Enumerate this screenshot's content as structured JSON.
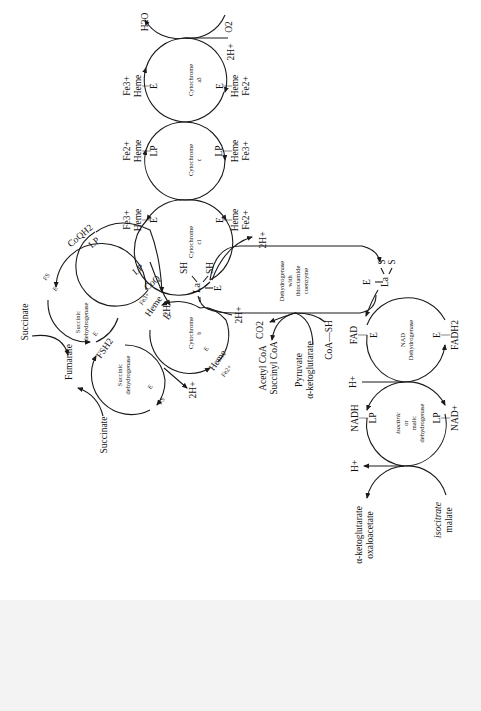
{
  "diagram": {
    "orientation": "rotated 90 degrees counter-clockwise (text reads bottom-to-top)",
    "enzymes": {
      "cyt_a3": {
        "line1": "Cytochrome",
        "line2": "a3"
      },
      "cyt_c": {
        "line1": "Cytochrome",
        "line2": "c"
      },
      "cyt_c1": {
        "line1": "Cytochrome",
        "line2": "c1"
      },
      "cyt_b": {
        "line1": "Cytochrome",
        "line2": "b"
      },
      "sdh_upper": {
        "line1": "Succinic",
        "line2": "dehydrogenase"
      },
      "sdh_lower": {
        "line1": "Succinic",
        "line2": "dehydrogenase"
      },
      "lipoamide": {
        "line1": "Dehydrogenase",
        "line2": "with",
        "line3": "thioctamide",
        "line4": "coenzyme"
      },
      "nad_dh": {
        "line1": "NAD",
        "line2": "Dehydrogenase"
      },
      "iso_malic": {
        "line1": "isocitric",
        "line2": "or",
        "line3": "malic",
        "line4": "dehydrogenase"
      }
    },
    "labels": {
      "h2o": "H2O",
      "o2": "O2",
      "two_h_plus": "2H+",
      "h_plus": "H+",
      "fe3": "Fe3+",
      "fe2": "Fe2+",
      "heme": "Heme",
      "e": "E",
      "lp": "LP",
      "bar": "|",
      "coqh2": "CoQH2",
      "coq": "CoQ",
      "fs": "FS",
      "fsh2": "FSH2",
      "succinate": "Succinate",
      "fumarate": "Fumarate",
      "sh": "SH",
      "la": "La",
      "s": "S",
      "co2": "CO2",
      "acetyl_coa": "Acetyl CoA",
      "succinyl_coa": "Succinyl CoA",
      "pyruvate": "Pyruvate",
      "alpha_kg": "α-ketoglutarate",
      "coa_sh": "CoA—SH",
      "fad": "FAD",
      "fadh2": "FADH2",
      "nadh": "NADH",
      "nad_plus": "NAD+",
      "alpha_kg2": "α-ketoglutarate",
      "oxaloacetate": "oxaloacetate",
      "isocitrate": "isocitrate",
      "malate": "malate"
    }
  }
}
